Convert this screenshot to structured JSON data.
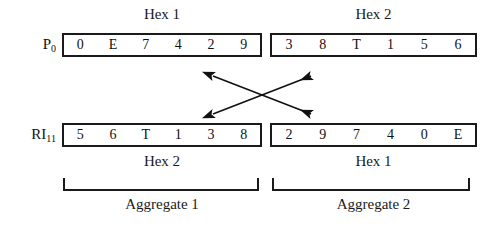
{
  "top_captions": [
    {
      "text": "Hex 1"
    },
    {
      "text": "Hex 2"
    }
  ],
  "bottom_captions": [
    {
      "text": "Hex 2"
    },
    {
      "text": "Hex 1"
    }
  ],
  "rows": [
    {
      "label_main": "P",
      "label_sub": "0",
      "boxes": [
        {
          "cells": [
            "0",
            "E",
            "7",
            "4",
            "2",
            "9"
          ]
        },
        {
          "cells": [
            "3",
            "8",
            "T",
            "1",
            "5",
            "6"
          ]
        }
      ]
    },
    {
      "label_main": "RI",
      "label_sub": "11",
      "boxes": [
        {
          "cells": [
            "5",
            "6",
            "T",
            "1",
            "3",
            "8"
          ]
        },
        {
          "cells": [
            "2",
            "9",
            "7",
            "4",
            "0",
            "E"
          ]
        }
      ]
    }
  ],
  "arrows": {
    "description": "two double-headed diagonal arrows forming an X",
    "color": "#111111"
  },
  "aggregates": [
    {
      "label": "Aggregate 1"
    },
    {
      "label": "Aggregate 2"
    }
  ],
  "colors": {
    "ink": "#111111",
    "border": "#1a1a1a",
    "background": "#ffffff"
  }
}
